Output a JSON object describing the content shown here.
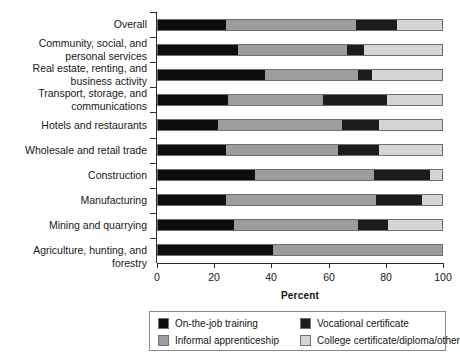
{
  "chart_data": {
    "type": "bar",
    "orientation": "horizontal",
    "stacked": true,
    "normalized": true,
    "title": "",
    "xlabel": "Percent",
    "ylabel": "",
    "xlim": [
      0,
      100
    ],
    "xticks": [
      0,
      20,
      40,
      60,
      80,
      100
    ],
    "grid": false,
    "legend_position": "below-axes",
    "categories": [
      "Overall",
      "Community, social, and\npersonal services",
      "Real estate, renting, and\nbusiness activity",
      "Transport, storage, and\ncommunications",
      "Hotels and restaurants",
      "Wholesale and retail trade",
      "Construction",
      "Manufacturing",
      "Mining and quarrying",
      "Agriculture, hunting, and forestry"
    ],
    "series": [
      {
        "name": "On-the-job training",
        "color": "#0d0d0d",
        "values": [
          24.1,
          28.3,
          37.8,
          24.5,
          21.0,
          24.1,
          34.0,
          24.1,
          26.6,
          40.6
        ]
      },
      {
        "name": "Informal apprenticeship",
        "color": "#9d9d9d",
        "values": [
          45.5,
          38.1,
          32.5,
          33.6,
          43.7,
          39.2,
          41.9,
          52.8,
          43.7,
          59.4
        ]
      },
      {
        "name": "Vocational certificate",
        "color": "#1c1c1c",
        "values": [
          14.7,
          6.3,
          5.2,
          22.7,
          13.3,
          14.7,
          20.0,
          16.1,
          10.7,
          0.0
        ]
      },
      {
        "name": "College certificate/diploma/other",
        "color": "#d5d5d5",
        "values": [
          15.7,
          27.3,
          24.5,
          19.2,
          22.0,
          22.0,
          4.1,
          7.0,
          19.0,
          0.0
        ]
      }
    ]
  },
  "axis": {
    "x_title": "Percent",
    "tick_labels": [
      "0",
      "20",
      "40",
      "60",
      "80",
      "100"
    ]
  },
  "legend": {
    "items": [
      {
        "label": "On-the-job training",
        "swatch": "s0"
      },
      {
        "label": "Vocational certificate",
        "swatch": "s2"
      },
      {
        "label": "Informal apprenticeship",
        "swatch": "s1"
      },
      {
        "label": "College certificate/diploma/other",
        "swatch": "s3"
      }
    ]
  },
  "colors": {
    "on_the_job": "#0d0d0d",
    "informal": "#9d9d9d",
    "vocational": "#1c1c1c",
    "college": "#d5d5d5",
    "axis": "#2b2b2b",
    "background": "#ffffff"
  }
}
